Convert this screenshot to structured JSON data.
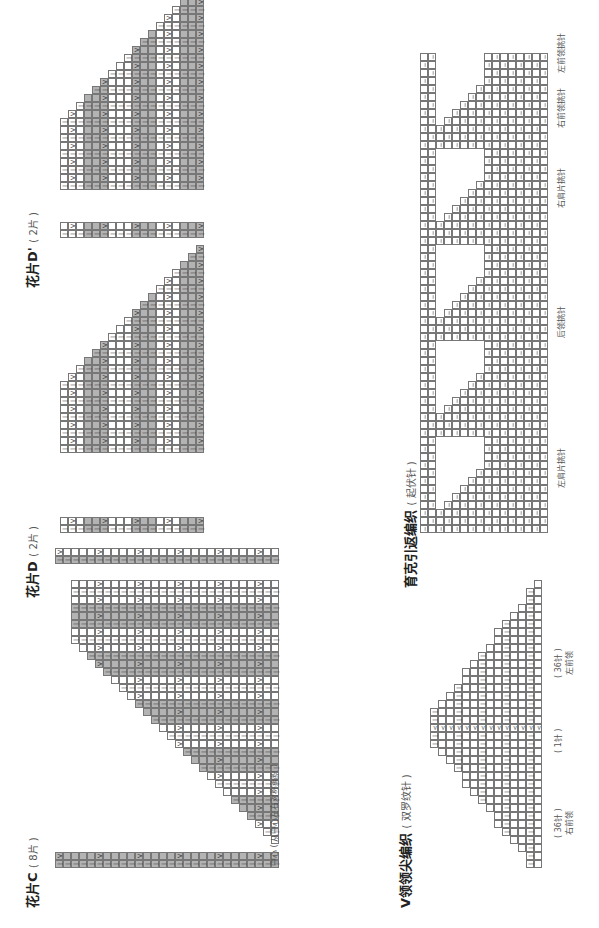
{
  "page": {
    "orientation": "rotated-90-ccw",
    "sections": [
      {
        "id": "piece-c",
        "title": "花片C",
        "subtitle": "( 8片 )",
        "row_marks": [
          "1",
          "5",
          "11",
          "17",
          "23",
          "29",
          "35",
          "41",
          "46"
        ],
        "stitch_marks": [
          "1",
          "5",
          "10",
          "15",
          "20",
          "25",
          "30",
          "35",
          "37"
        ],
        "center_note": "中心 ( 从中心左右对称编织 )"
      },
      {
        "id": "piece-d",
        "title": "花片D",
        "subtitle": "( 2片 )",
        "row_marks": [
          "1",
          "5",
          "11",
          "17",
          "23",
          "29",
          "35",
          "41",
          "46",
          "47"
        ],
        "stitch_marks": [
          "1",
          "5",
          "10",
          "15",
          "20",
          "25",
          "30",
          "35",
          "37"
        ],
        "bottom_row_numbers": [
          "1",
          "2",
          "3",
          "4",
          "5",
          "6",
          "7",
          "8"
        ]
      },
      {
        "id": "piece-d-prime",
        "title": "花片D'",
        "subtitle": "( 2片 )",
        "row_marks": [
          "1",
          "5",
          "11",
          "17",
          "23",
          "29",
          "35",
          "41",
          "46",
          "47"
        ],
        "stitch_marks": [
          "1",
          "5",
          "10",
          "15",
          "20",
          "25",
          "30",
          "35",
          "37"
        ]
      },
      {
        "id": "v-neck",
        "title": "V领领尖编织",
        "subtitle": "( 双罗纹针 )",
        "row_marks": [
          "1",
          "5",
          "12"
        ],
        "brace_labels": [
          {
            "count": "( 36针 )",
            "name": "右前领"
          },
          {
            "count": "( 1针 )",
            "name": ""
          },
          {
            "count": "( 36针 )",
            "name": "左前领"
          }
        ]
      },
      {
        "id": "yoke-short-rows",
        "title": "育克引返编织",
        "subtitle": "( 起伏针 )",
        "row_marks": [
          "1",
          "5",
          "10",
          "15",
          "17",
          "21",
          "22"
        ],
        "brace_labels": [
          "左肩片挑针",
          "后领挑针",
          "右肩片挑针",
          "右前领挑针",
          "左前领挑针"
        ],
        "stitch_marks": [
          "40",
          "25",
          "10",
          "5",
          "1",
          "1",
          "20",
          "19",
          "1",
          "40",
          "10",
          "5",
          "1",
          "36",
          "1",
          "36",
          "1"
        ]
      }
    ]
  }
}
